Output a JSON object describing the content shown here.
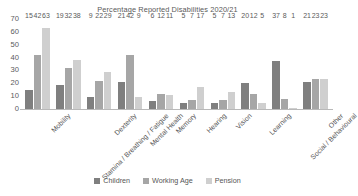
{
  "chart_data": {
    "type": "bar",
    "title": "Percentage Reported Disabilities 2020/21",
    "xlabel": "",
    "ylabel": "",
    "ylim": [
      0,
      70
    ],
    "yticks": [
      0,
      10,
      20,
      30,
      40,
      50,
      60,
      70
    ],
    "grid": false,
    "legend_position": "bottom",
    "categories": [
      "Mobility",
      "Stamina / Breathing / Fatigue",
      "Dexterity",
      "Mental Health",
      "Memory",
      "Hearing",
      "Vision",
      "Learning",
      "Social / Behavioural",
      "Other"
    ],
    "series": [
      {
        "name": "Children",
        "color": "#7f7f7f",
        "values": [
          15,
          19,
          9,
          21,
          6,
          5,
          5,
          20,
          37,
          21
        ]
      },
      {
        "name": "Working Age",
        "color": "#a6a6a6",
        "values": [
          42,
          32,
          22,
          42,
          12,
          7,
          7,
          12,
          8,
          23
        ]
      },
      {
        "name": "Pension",
        "color": "#cfcfcf",
        "values": [
          63,
          38,
          29,
          9,
          11,
          17,
          13,
          5,
          1,
          23
        ]
      }
    ]
  },
  "axis": {
    "tick_labels": [
      "70",
      "60",
      "50",
      "40",
      "30",
      "20",
      "10",
      "0"
    ]
  },
  "legend": {
    "items": [
      {
        "label": "Children",
        "color": "#7f7f7f"
      },
      {
        "label": "Working Age",
        "color": "#a6a6a6"
      },
      {
        "label": "Pension",
        "color": "#cfcfcf"
      }
    ]
  }
}
